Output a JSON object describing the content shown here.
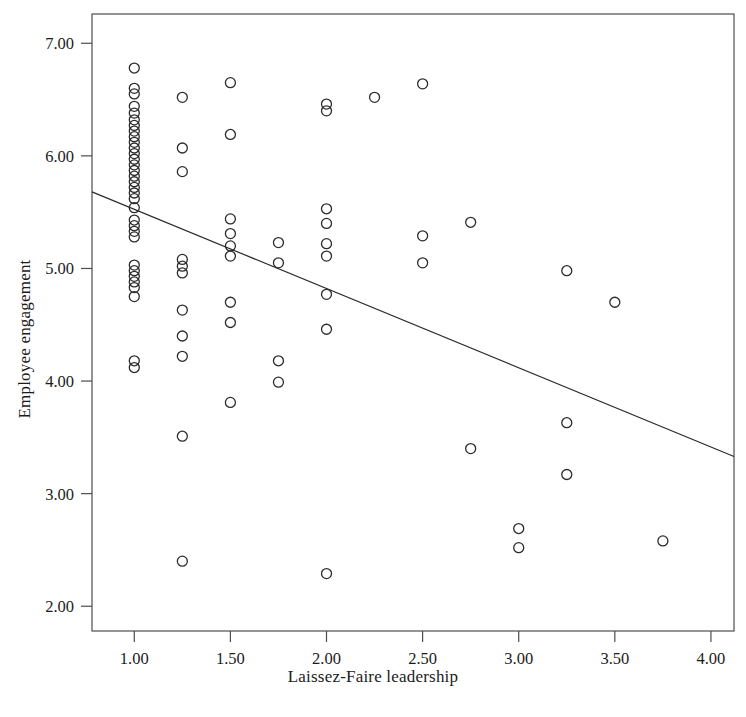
{
  "chart_data": {
    "type": "scatter",
    "title": "",
    "xlabel": "Laissez-Faire leadership",
    "ylabel": "Employee engagement",
    "xlim": [
      0.78,
      4.12
    ],
    "ylim": [
      1.78,
      7.26
    ],
    "xticks": [
      1.0,
      1.5,
      2.0,
      2.5,
      3.0,
      3.5,
      4.0
    ],
    "xticklabels": [
      "1.00",
      "1.50",
      "2.00",
      "2.50",
      "3.00",
      "3.50",
      "4.00"
    ],
    "yticks": [
      2.0,
      3.0,
      4.0,
      5.0,
      6.0,
      7.0
    ],
    "yticklabels": [
      "2.00",
      "3.00",
      "4.00",
      "5.00",
      "6.00",
      "7.00"
    ],
    "grid": false,
    "legend": null,
    "marker": {
      "shape": "open-circle",
      "radius": 5.0,
      "stroke": "#2b2b2b",
      "stroke_width": 1.3,
      "fill": "none"
    },
    "fit_line": {
      "type": "linear",
      "stroke": "#2b2b2b",
      "stroke_width": 1.2,
      "x_start": 0.78,
      "y_start": 5.68,
      "x_end": 4.12,
      "y_end": 3.33
    },
    "points": [
      [
        1.0,
        6.78
      ],
      [
        1.0,
        6.6
      ],
      [
        1.0,
        6.55
      ],
      [
        1.0,
        6.44
      ],
      [
        1.0,
        6.38
      ],
      [
        1.0,
        6.32
      ],
      [
        1.0,
        6.27
      ],
      [
        1.0,
        6.22
      ],
      [
        1.0,
        6.17
      ],
      [
        1.0,
        6.12
      ],
      [
        1.0,
        6.07
      ],
      [
        1.0,
        6.02
      ],
      [
        1.0,
        5.97
      ],
      [
        1.0,
        5.92
      ],
      [
        1.0,
        5.87
      ],
      [
        1.0,
        5.82
      ],
      [
        1.0,
        5.77
      ],
      [
        1.0,
        5.72
      ],
      [
        1.0,
        5.67
      ],
      [
        1.0,
        5.62
      ],
      [
        1.0,
        5.54
      ],
      [
        1.0,
        5.43
      ],
      [
        1.0,
        5.38
      ],
      [
        1.0,
        5.33
      ],
      [
        1.0,
        5.28
      ],
      [
        1.0,
        5.03
      ],
      [
        1.0,
        4.98
      ],
      [
        1.0,
        4.93
      ],
      [
        1.0,
        4.88
      ],
      [
        1.0,
        4.83
      ],
      [
        1.0,
        4.75
      ],
      [
        1.0,
        4.18
      ],
      [
        1.0,
        4.12
      ],
      [
        1.25,
        6.52
      ],
      [
        1.25,
        6.07
      ],
      [
        1.25,
        5.86
      ],
      [
        1.25,
        5.08
      ],
      [
        1.25,
        5.02
      ],
      [
        1.25,
        4.96
      ],
      [
        1.25,
        4.63
      ],
      [
        1.25,
        4.4
      ],
      [
        1.25,
        4.22
      ],
      [
        1.25,
        3.51
      ],
      [
        1.25,
        2.4
      ],
      [
        1.5,
        6.65
      ],
      [
        1.5,
        6.19
      ],
      [
        1.5,
        5.44
      ],
      [
        1.5,
        5.31
      ],
      [
        1.5,
        5.2
      ],
      [
        1.5,
        5.11
      ],
      [
        1.5,
        4.7
      ],
      [
        1.5,
        4.52
      ],
      [
        1.5,
        3.81
      ],
      [
        1.75,
        5.23
      ],
      [
        1.75,
        5.05
      ],
      [
        1.75,
        4.18
      ],
      [
        1.75,
        3.99
      ],
      [
        2.0,
        6.46
      ],
      [
        2.0,
        6.4
      ],
      [
        2.0,
        5.53
      ],
      [
        2.0,
        5.4
      ],
      [
        2.0,
        5.22
      ],
      [
        2.0,
        5.11
      ],
      [
        2.0,
        4.77
      ],
      [
        2.0,
        4.46
      ],
      [
        2.0,
        2.29
      ],
      [
        2.25,
        6.52
      ],
      [
        2.5,
        6.64
      ],
      [
        2.5,
        5.29
      ],
      [
        2.5,
        5.05
      ],
      [
        2.75,
        5.41
      ],
      [
        2.75,
        3.4
      ],
      [
        3.0,
        2.69
      ],
      [
        3.0,
        2.52
      ],
      [
        3.25,
        4.98
      ],
      [
        3.25,
        3.63
      ],
      [
        3.25,
        3.17
      ],
      [
        3.5,
        4.7
      ],
      [
        3.75,
        2.58
      ]
    ]
  },
  "frame": {
    "border_color": "#4d4d4d",
    "background": "#ffffff"
  }
}
